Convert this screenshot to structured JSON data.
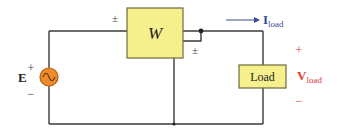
{
  "diagram": {
    "colors": {
      "wire": "#3a3a3a",
      "box_fill": "#f5ef8c",
      "box_stroke": "#6e6a3a",
      "source_fill": "#ef8c2a",
      "source_stroke": "#b85c10",
      "current_label": "#3a4a9a",
      "voltage_label": "#e03a2a",
      "text": "#222222"
    },
    "wattmeter": {
      "label": "W",
      "current_coil_marker": "±",
      "voltage_coil_marker": "±"
    },
    "source": {
      "label": "E",
      "plus": "+",
      "minus": "−",
      "icon": "ac-source-icon"
    },
    "load": {
      "label": "Load"
    },
    "current": {
      "symbol": "I",
      "subscript": "load",
      "arrow": "right"
    },
    "voltage": {
      "symbol": "V",
      "subscript": "load",
      "plus": "+",
      "minus": "−"
    }
  }
}
